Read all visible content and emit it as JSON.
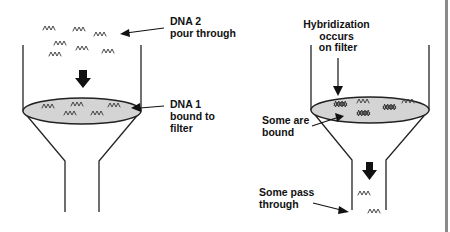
{
  "diagram": {
    "left_panel": {
      "label_dna2_line1": "DNA 2",
      "label_dna2_line2": "pour through",
      "label_dna1_line1": "DNA 1",
      "label_dna1_line2": "bound to",
      "label_dna1_line3": "filter"
    },
    "right_panel": {
      "label_hyb_line1": "Hybridization",
      "label_hyb_line2": "occurs",
      "label_hyb_line3": "on filter",
      "label_bound_line1": "Some are",
      "label_bound_line2": "bound",
      "label_pass_line1": "Some pass",
      "label_pass_line2": "through"
    },
    "colors": {
      "filter_fill": "#d4d4d4",
      "line": "#222222",
      "text": "#111111",
      "edge_bar": "#8a8a8a"
    }
  }
}
